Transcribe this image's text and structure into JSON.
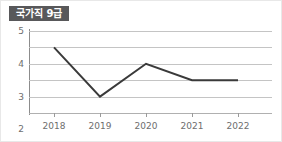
{
  "badge": {
    "label": "국가직 9급",
    "background_color": "#58585a",
    "text_color": "#ffffff"
  },
  "colors": {
    "series_line": "#3a3a3a",
    "gridline": "#c4c4c4",
    "axis": "#8c8c8c",
    "tick_text": "#6e6e6e",
    "background": "#ffffff"
  },
  "chart_data": {
    "type": "line",
    "title": "국가직 9급",
    "xlabel": "",
    "ylabel": "",
    "categories": [
      "2018",
      "2019",
      "2020",
      "2021",
      "2022"
    ],
    "x": [
      2018,
      2019,
      2020,
      2021,
      2022
    ],
    "values": [
      4,
      1,
      3,
      2,
      2
    ],
    "series": [
      {
        "name": "국가직 9급",
        "values": [
          4,
          1,
          3,
          2,
          2
        ]
      }
    ],
    "ylim": [
      0,
      5
    ],
    "yticks": [
      0,
      1,
      2,
      3,
      4,
      5
    ],
    "ytick_labels": [
      "0",
      "1",
      "2",
      "3",
      "4",
      "5"
    ],
    "grid": true,
    "legend": false,
    "markers": false
  }
}
